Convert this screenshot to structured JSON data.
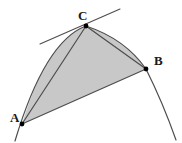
{
  "figure": {
    "type": "geometry-diagram",
    "background_color": "#ffffff",
    "fill_color": "#c8c8c8",
    "stroke_color": "#4d4d4d",
    "point_color": "#000000",
    "width": 182,
    "height": 143,
    "labels": {
      "a": "A",
      "b": "B",
      "c": "C"
    },
    "label_positions": {
      "a": {
        "x": 10,
        "y": 122
      },
      "b": {
        "x": 154,
        "y": 65
      },
      "c": {
        "x": 78,
        "y": 20
      }
    },
    "points": {
      "a": {
        "x": 22,
        "y": 124
      },
      "b": {
        "x": 146,
        "y": 69
      },
      "c": {
        "x": 86,
        "y": 26
      }
    },
    "parabola": {
      "vertex": {
        "x": 99,
        "y": 22
      },
      "start": {
        "x": 15,
        "y": 141
      },
      "end": {
        "x": 176,
        "y": 140
      }
    },
    "tangent_line": {
      "start": {
        "x": 40,
        "y": 44
      },
      "end": {
        "x": 120,
        "y": 9
      }
    },
    "chords": [
      {
        "name": "AC",
        "from": "a",
        "to": "c"
      },
      {
        "name": "CB",
        "from": "c",
        "to": "b"
      },
      {
        "name": "AB",
        "from": "a",
        "to": "b"
      }
    ],
    "shaded_region": "parabolic segment bounded by chord AB and the arc A-C-B"
  }
}
